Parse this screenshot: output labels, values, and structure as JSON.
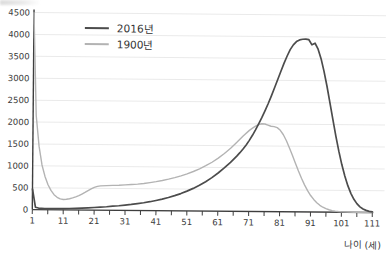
{
  "chart_data": {
    "type": "line",
    "title": "",
    "xlabel": "나이 (세)",
    "ylabel": "",
    "xlim": [
      1,
      111
    ],
    "ylim": [
      0,
      4500
    ],
    "y_ticks": [
      0,
      500,
      1000,
      1500,
      2000,
      2500,
      3000,
      3500,
      4000,
      4500
    ],
    "x_tick_labels": [
      1,
      11,
      21,
      31,
      41,
      51,
      61,
      71,
      81,
      91,
      101,
      111
    ],
    "x_minor_tick_step": 5,
    "grid": "horizontal",
    "legend_position": "top-left-inside",
    "colors": {
      "axis": "#3e3e3e",
      "gridline": "#eaeaea",
      "tick_text": "#3a3a3a"
    },
    "series": [
      {
        "name": "2016년",
        "color": "#4c4c4c",
        "stroke_width": 1.7,
        "points": [
          [
            1,
            470
          ],
          [
            2,
            55
          ],
          [
            3,
            36
          ],
          [
            5,
            28
          ],
          [
            7,
            26
          ],
          [
            9,
            26
          ],
          [
            11,
            28
          ],
          [
            13,
            31
          ],
          [
            15,
            36
          ],
          [
            17,
            43
          ],
          [
            19,
            51
          ],
          [
            21,
            60
          ],
          [
            23,
            70
          ],
          [
            25,
            81
          ],
          [
            27,
            93
          ],
          [
            29,
            106
          ],
          [
            31,
            121
          ],
          [
            33,
            138
          ],
          [
            35,
            157
          ],
          [
            37,
            179
          ],
          [
            39,
            204
          ],
          [
            41,
            233
          ],
          [
            43,
            266
          ],
          [
            45,
            304
          ],
          [
            47,
            347
          ],
          [
            49,
            396
          ],
          [
            51,
            452
          ],
          [
            53,
            516
          ],
          [
            55,
            589
          ],
          [
            57,
            672
          ],
          [
            59,
            766
          ],
          [
            61,
            872
          ],
          [
            63,
            990
          ],
          [
            65,
            1120
          ],
          [
            67,
            1262
          ],
          [
            68,
            1340
          ],
          [
            69,
            1425
          ],
          [
            70,
            1520
          ],
          [
            71,
            1625
          ],
          [
            72,
            1740
          ],
          [
            73,
            1865
          ],
          [
            74,
            2000
          ],
          [
            75,
            2145
          ],
          [
            76,
            2300
          ],
          [
            77,
            2465
          ],
          [
            78,
            2640
          ],
          [
            79,
            2825
          ],
          [
            80,
            3015
          ],
          [
            81,
            3205
          ],
          [
            82,
            3390
          ],
          [
            83,
            3560
          ],
          [
            84,
            3705
          ],
          [
            85,
            3815
          ],
          [
            86,
            3890
          ],
          [
            87,
            3930
          ],
          [
            88,
            3945
          ],
          [
            89,
            3950
          ],
          [
            90,
            3935
          ],
          [
            91,
            3820
          ],
          [
            92,
            3855
          ],
          [
            93,
            3720
          ],
          [
            94,
            3500
          ],
          [
            95,
            3215
          ],
          [
            96,
            2875
          ],
          [
            97,
            2500
          ],
          [
            98,
            2115
          ],
          [
            99,
            1740
          ],
          [
            100,
            1395
          ],
          [
            101,
            1090
          ],
          [
            102,
            830
          ],
          [
            103,
            610
          ],
          [
            104,
            435
          ],
          [
            105,
            300
          ],
          [
            106,
            200
          ],
          [
            107,
            128
          ],
          [
            108,
            80
          ],
          [
            109,
            48
          ],
          [
            110,
            28
          ],
          [
            111,
            17
          ]
        ]
      },
      {
        "name": "1900년",
        "color": "#b3b3b3",
        "stroke_width": 1.4,
        "points": [
          [
            1,
            4500
          ],
          [
            2,
            2150
          ],
          [
            3,
            1450
          ],
          [
            4,
            1020
          ],
          [
            5,
            760
          ],
          [
            6,
            570
          ],
          [
            7,
            440
          ],
          [
            8,
            345
          ],
          [
            9,
            285
          ],
          [
            10,
            250
          ],
          [
            11,
            238
          ],
          [
            12,
            242
          ],
          [
            13,
            255
          ],
          [
            14,
            275
          ],
          [
            15,
            300
          ],
          [
            16,
            330
          ],
          [
            17,
            365
          ],
          [
            18,
            403
          ],
          [
            19,
            443
          ],
          [
            20,
            485
          ],
          [
            21,
            520
          ],
          [
            22,
            543
          ],
          [
            23,
            555
          ],
          [
            25,
            562
          ],
          [
            27,
            568
          ],
          [
            29,
            574
          ],
          [
            31,
            582
          ],
          [
            33,
            592
          ],
          [
            35,
            604
          ],
          [
            37,
            620
          ],
          [
            39,
            640
          ],
          [
            41,
            663
          ],
          [
            43,
            690
          ],
          [
            45,
            722
          ],
          [
            47,
            758
          ],
          [
            49,
            800
          ],
          [
            51,
            848
          ],
          [
            53,
            903
          ],
          [
            55,
            965
          ],
          [
            57,
            1036
          ],
          [
            59,
            1118
          ],
          [
            61,
            1212
          ],
          [
            63,
            1320
          ],
          [
            65,
            1442
          ],
          [
            67,
            1578
          ],
          [
            69,
            1722
          ],
          [
            71,
            1852
          ],
          [
            72,
            1905
          ],
          [
            73,
            1950
          ],
          [
            74,
            1985
          ],
          [
            75,
            2005
          ],
          [
            76,
            2000
          ],
          [
            77,
            1975
          ],
          [
            78,
            1950
          ],
          [
            79,
            1945
          ],
          [
            80,
            1920
          ],
          [
            81,
            1860
          ],
          [
            82,
            1760
          ],
          [
            83,
            1625
          ],
          [
            84,
            1465
          ],
          [
            85,
            1290
          ],
          [
            86,
            1110
          ],
          [
            87,
            935
          ],
          [
            88,
            770
          ],
          [
            89,
            620
          ],
          [
            90,
            488
          ],
          [
            91,
            378
          ],
          [
            92,
            287
          ],
          [
            93,
            214
          ],
          [
            94,
            156
          ],
          [
            95,
            112
          ],
          [
            96,
            79
          ],
          [
            97,
            55
          ],
          [
            98,
            37
          ],
          [
            99,
            25
          ],
          [
            100,
            16
          ],
          [
            101,
            10
          ],
          [
            103,
            5
          ],
          [
            105,
            2
          ],
          [
            108,
            1
          ],
          [
            111,
            0
          ]
        ]
      }
    ]
  },
  "legend": {
    "items": [
      {
        "label": "2016년",
        "color": "#4c4c4c"
      },
      {
        "label": "1900년",
        "color": "#b3b3b3"
      }
    ]
  },
  "axis": {
    "x_title": "나이 (세)"
  }
}
